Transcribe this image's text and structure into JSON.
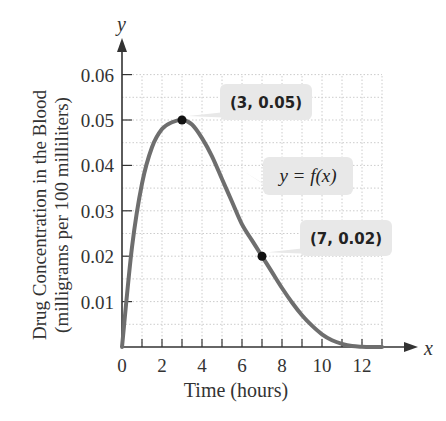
{
  "chart_data": {
    "type": "line",
    "title": "",
    "xlabel": "Time (hours)",
    "ylabel": "Drug Concentration in the Blood (milligrams per 100 milliliters)",
    "ylabel_line1": "Drug Concentration in the Blood",
    "ylabel_line2": "(milligrams per 100 milliliters)",
    "x_axis_symbol": "x",
    "y_axis_symbol": "y",
    "x_ticks": [
      0,
      2,
      4,
      6,
      8,
      10,
      12
    ],
    "y_ticks": [
      "0.01",
      "0.02",
      "0.03",
      "0.04",
      "0.05",
      "0.06"
    ],
    "xlim": [
      0,
      13
    ],
    "ylim": [
      0,
      0.06
    ],
    "grid": true,
    "series": [
      {
        "name": "y = f(x)",
        "x": [
          0,
          0.5,
          1,
          1.5,
          2,
          2.5,
          3,
          3.5,
          4,
          4.5,
          5,
          5.5,
          6,
          6.5,
          7,
          7.5,
          8,
          8.5,
          9,
          9.5,
          10,
          10.5,
          11,
          11.5,
          12,
          12.5,
          13
        ],
        "y": [
          0,
          0.022,
          0.036,
          0.044,
          0.048,
          0.0495,
          0.05,
          0.049,
          0.046,
          0.042,
          0.037,
          0.032,
          0.027,
          0.0235,
          0.02,
          0.0165,
          0.013,
          0.0098,
          0.007,
          0.0047,
          0.0028,
          0.0015,
          0.0007,
          0.0002,
          5e-05,
          0,
          0
        ]
      }
    ],
    "annotations": [
      {
        "label": "(3, 0.05)",
        "x": 3,
        "y": 0.05
      },
      {
        "label": "(7, 0.02)",
        "x": 7,
        "y": 0.02
      },
      {
        "label": "y = f(x)",
        "x": 6.3,
        "y": 0.04
      }
    ]
  }
}
